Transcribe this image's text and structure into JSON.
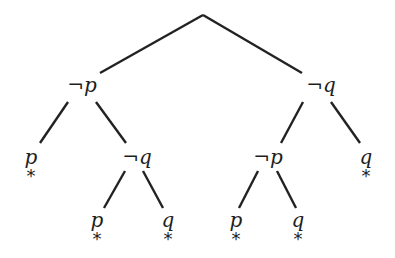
{
  "diagram": {
    "type": "semantic-tableau-tree",
    "nodes": [
      {
        "id": "root",
        "neg": "",
        "var": "",
        "x": 203,
        "y": 15,
        "closed": false
      },
      {
        "id": "n1",
        "neg": "¬",
        "var": "p",
        "x": 82,
        "y": 85,
        "closed": false
      },
      {
        "id": "n2",
        "neg": "¬",
        "var": "q",
        "x": 321,
        "y": 85,
        "closed": false
      },
      {
        "id": "n3",
        "neg": "",
        "var": "p",
        "x": 31,
        "y": 157,
        "closed": true
      },
      {
        "id": "n4",
        "neg": "¬",
        "var": "q",
        "x": 137,
        "y": 157,
        "closed": false
      },
      {
        "id": "n5",
        "neg": "¬",
        "var": "p",
        "x": 268,
        "y": 157,
        "closed": false
      },
      {
        "id": "n6",
        "neg": "",
        "var": "q",
        "x": 366,
        "y": 157,
        "closed": true
      },
      {
        "id": "n7",
        "neg": "",
        "var": "p",
        "x": 97,
        "y": 220,
        "closed": true
      },
      {
        "id": "n8",
        "neg": "",
        "var": "q",
        "x": 168,
        "y": 220,
        "closed": true
      },
      {
        "id": "n9",
        "neg": "",
        "var": "p",
        "x": 236,
        "y": 220,
        "closed": true
      },
      {
        "id": "n10",
        "neg": "",
        "var": "q",
        "x": 298,
        "y": 220,
        "closed": true
      }
    ],
    "edges": [
      {
        "x1": 203,
        "y1": 15,
        "x2": 100,
        "y2": 73
      },
      {
        "x1": 203,
        "y1": 15,
        "x2": 302,
        "y2": 73
      },
      {
        "x1": 68,
        "y1": 102,
        "x2": 40,
        "y2": 143
      },
      {
        "x1": 96,
        "y1": 102,
        "x2": 126,
        "y2": 143
      },
      {
        "x1": 303,
        "y1": 102,
        "x2": 281,
        "y2": 143
      },
      {
        "x1": 331,
        "y1": 102,
        "x2": 360,
        "y2": 143
      },
      {
        "x1": 125,
        "y1": 171,
        "x2": 104,
        "y2": 208
      },
      {
        "x1": 143,
        "y1": 171,
        "x2": 163,
        "y2": 208
      },
      {
        "x1": 258,
        "y1": 171,
        "x2": 239,
        "y2": 208
      },
      {
        "x1": 277,
        "y1": 171,
        "x2": 296,
        "y2": 208
      }
    ],
    "closed_marker": "*",
    "line_color": "#222222",
    "text_color": "#1e1e1e"
  }
}
